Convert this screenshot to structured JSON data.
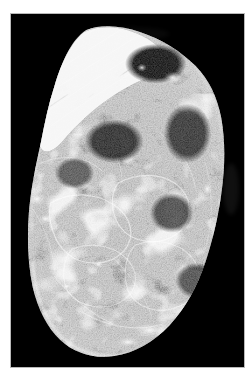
{
  "figure": {
    "kind": "micrograph",
    "modality": "fluorescence / darkfield microscopy",
    "color_mode": "grayscale",
    "caption": "",
    "page_background": "#ffffff",
    "plate_background": "#000000",
    "plate_border_color": "#b9b9b9",
    "signal_color": "#ffffff",
    "plate": {
      "x": 10,
      "y": 13,
      "width": 235,
      "height": 355
    }
  },
  "specimen": {
    "label": "tissue specimen",
    "description": "irregular ovoid tissue mass on black background with bright filamentous network",
    "features": [
      {
        "name": "fibrous-band",
        "label": "striated fibre bundle",
        "location": "upper-left",
        "brightness": "high"
      },
      {
        "name": "filament-network",
        "label": "branching filament network",
        "location": "centre and lower half",
        "brightness": "medium"
      },
      {
        "name": "dark-void",
        "label": "unstained void",
        "location": "upper centre-right",
        "brightness": "none"
      },
      {
        "name": "bright-rim",
        "label": "bright specimen margin",
        "location": "lower border",
        "brightness": "high"
      }
    ]
  },
  "chart_data": {
    "type": "heatmap",
    "title": "",
    "xlabel": "",
    "ylabel": "",
    "grid": false,
    "legend": "none",
    "colormap": "grayscale",
    "value_range": [
      0,
      255
    ],
    "note": "intensity map of a fluorescence micrograph; no axes or tick labels are rendered"
  },
  "annotations": {
    "scalebar": null,
    "labels": [],
    "overlay_text": ""
  }
}
